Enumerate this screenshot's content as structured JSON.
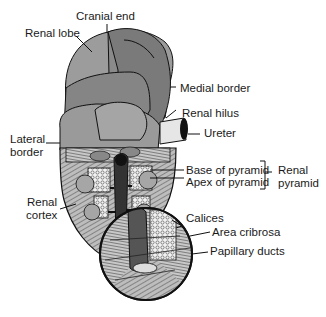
{
  "diagram": {
    "labels": {
      "cranial_end": "Cranial end",
      "renal_lobe": "Renal lobe",
      "medial_border": "Medial border",
      "renal_hilus": "Renal hilus",
      "ureter": "Ureter",
      "lateral_border_1": "Lateral",
      "lateral_border_2": "border",
      "base_of_pyramid": "Base of pyramid",
      "apex_of_pyramid": "Apex of pyramid",
      "renal_pyramid_1": "Renal",
      "renal_pyramid_2": "pyramid",
      "renal_cortex_1": "Renal",
      "renal_cortex_2": "cortex",
      "calices": "Calices",
      "area_cribrosa": "Area cribrosa",
      "papillary_ducts": "Papillary ducts"
    },
    "colors": {
      "lobe_light": "#9a9a9a",
      "lobe_dark": "#777777",
      "outline": "#111111",
      "ureter": "#e6e6e6",
      "medulla": "#8a8a8a",
      "pelvis": "#333333"
    }
  }
}
